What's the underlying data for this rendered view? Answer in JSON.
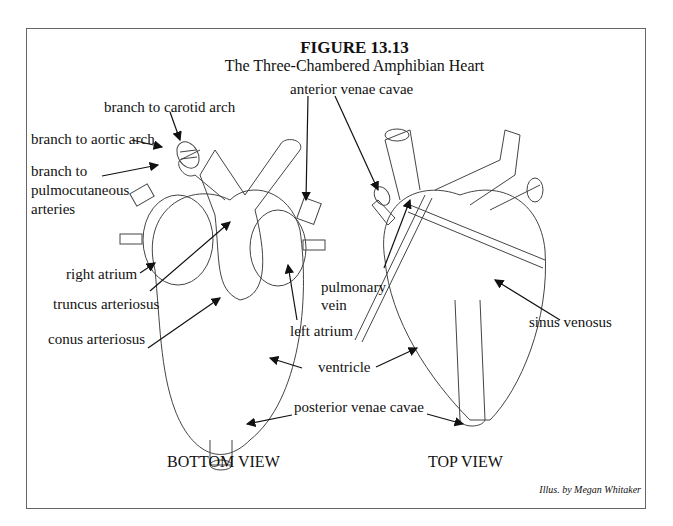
{
  "figure": {
    "number": "FIGURE 13.13",
    "title": "The Three-Chambered Amphibian Heart",
    "credit": "Illus. by  Megan Whitaker"
  },
  "views": {
    "bottom": "BOTTOM VIEW",
    "top": "TOP VIEW"
  },
  "labels": {
    "carotid": "branch to carotid arch",
    "aortic": "branch to aortic arch",
    "pulmo1": "branch to",
    "pulmo2": "pulmocutaneous",
    "pulmo3": "arteries",
    "right_atrium": "right atrium",
    "truncus": "truncus arteriosus",
    "conus": "conus arteriosus",
    "left_atrium": "left atrium",
    "anterior": "anterior venae cavae",
    "pulm_vein1": "pulmonary",
    "pulm_vein2": "vein",
    "sinus": "sinus venosus",
    "ventricle": "ventricle",
    "posterior": "posterior venae cavae"
  }
}
